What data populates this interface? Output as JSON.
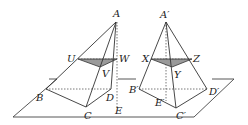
{
  "figure": {
    "colors": {
      "line": "#333333",
      "shade": "#9a9a9a",
      "background": "#ffffff"
    },
    "left_pyramid": {
      "labels": {
        "apex": "A",
        "u": "U",
        "v": "V",
        "w": "W",
        "b": "B",
        "c": "C",
        "d": "D",
        "e": "E"
      }
    },
    "right_pyramid": {
      "labels": {
        "apex": "A′",
        "x": "X",
        "y": "Y",
        "z": "Z",
        "b": "B′",
        "c": "C′",
        "d": "D′",
        "e": "E′"
      }
    }
  }
}
